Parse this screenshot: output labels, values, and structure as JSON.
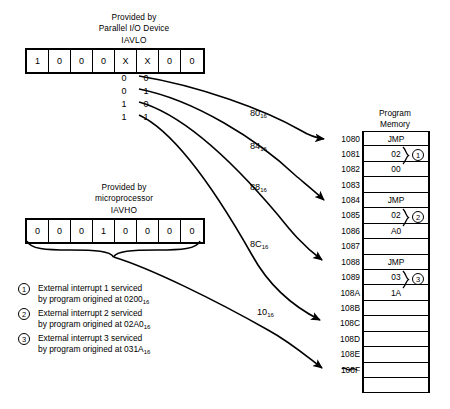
{
  "iavlo": {
    "caption_line1": "Provided by",
    "caption_line2": "Parallel I/O Device",
    "name": "IAVLO",
    "bits": [
      "1",
      "0",
      "0",
      "0",
      "X",
      "X",
      "0",
      "0"
    ],
    "truth_table": [
      [
        "0",
        "0"
      ],
      [
        "0",
        "1"
      ],
      [
        "1",
        "0"
      ],
      [
        "1",
        "1"
      ]
    ]
  },
  "iavho": {
    "caption_line1": "Provided by",
    "caption_line2": "microprocessor",
    "name": "IAVHO",
    "bits": [
      "0",
      "0",
      "0",
      "1",
      "0",
      "0",
      "0",
      "0"
    ]
  },
  "vectors": [
    {
      "label": "80",
      "sub": "16"
    },
    {
      "label": "84",
      "sub": "16"
    },
    {
      "label": "88",
      "sub": "16"
    },
    {
      "label": "8C",
      "sub": "16"
    },
    {
      "label": "10",
      "sub": "16"
    }
  ],
  "program_memory": {
    "title_line1": "Program",
    "title_line2": "Memory",
    "rows": [
      {
        "addr": "1080",
        "value": "JMP"
      },
      {
        "addr": "1081",
        "value": "02"
      },
      {
        "addr": "1082",
        "value": "00"
      },
      {
        "addr": "1083",
        "value": ""
      },
      {
        "addr": "1084",
        "value": "JMP"
      },
      {
        "addr": "1085",
        "value": "02"
      },
      {
        "addr": "1086",
        "value": "A0"
      },
      {
        "addr": "1087",
        "value": ""
      },
      {
        "addr": "1088",
        "value": "JMP"
      },
      {
        "addr": "1089",
        "value": "03"
      },
      {
        "addr": "108A",
        "value": "1A"
      },
      {
        "addr": "108B",
        "value": ""
      },
      {
        "addr": "108C",
        "value": ""
      },
      {
        "addr": "108D",
        "value": ""
      },
      {
        "addr": "108E",
        "value": ""
      },
      {
        "addr": "108F",
        "value": ""
      },
      {
        "addr": "",
        "value": ""
      }
    ],
    "groups": [
      {
        "num": "1"
      },
      {
        "num": "2"
      },
      {
        "num": "3"
      }
    ]
  },
  "legend": [
    {
      "num": "1",
      "line1": "External interrupt 1 serviced",
      "line2_pre": "by program origined at 0200",
      "line2_sub": "16"
    },
    {
      "num": "2",
      "line1": "External interrupt 2 serviced",
      "line2_pre": "by program origined at 02A0",
      "line2_sub": "16"
    },
    {
      "num": "3",
      "line1": "External interrupt 3 serviced",
      "line2_pre": "by program origined at 031A",
      "line2_sub": "16"
    }
  ]
}
